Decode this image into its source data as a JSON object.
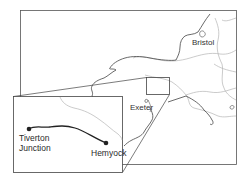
{
  "map": {
    "labels": {
      "bristol": "Bristol",
      "exeter": "Exeter"
    },
    "inset": {
      "start_label_line1": "Tiverton",
      "start_label_line2": "Junction",
      "end_label": "Hemyock"
    },
    "colors": {
      "frame": "#555555",
      "coast": "#444444",
      "boundary": "#b0b0b0",
      "route": "#222222"
    }
  }
}
